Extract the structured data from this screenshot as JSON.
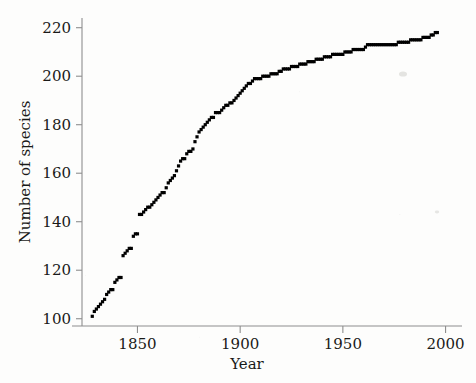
{
  "figure": {
    "background_color": "#fdfdfc",
    "marker_color": "#000000",
    "axis_color": "#8e8e8e"
  },
  "axes": {
    "x_label": "Year",
    "y_label": "Number of species",
    "x_ticks": [
      "1850",
      "1900",
      "1950",
      "2000"
    ],
    "y_ticks": [
      "100",
      "120",
      "140",
      "160",
      "180",
      "200",
      "220"
    ]
  },
  "chart_data": {
    "type": "scatter",
    "title": "",
    "xlabel": "Year",
    "ylabel": "Number of species",
    "xlim": [
      1823,
      2008
    ],
    "ylim": [
      97,
      224
    ],
    "xticks": [
      1850,
      1900,
      1950,
      2000
    ],
    "yticks": [
      100,
      120,
      140,
      160,
      180,
      200,
      220
    ],
    "grid": false,
    "legend": false,
    "marker": "square",
    "marker_color": "#000000",
    "series": [
      {
        "name": "Cumulative species described",
        "x": [
          1828,
          1830,
          1831,
          1832,
          1833,
          1834,
          1835,
          1836,
          1837,
          1838,
          1839,
          1840,
          1841,
          1842,
          1843,
          1844,
          1845,
          1846,
          1847,
          1848,
          1849,
          1850,
          1851,
          1852,
          1853,
          1854,
          1855,
          1856,
          1857,
          1858,
          1859,
          1860,
          1861,
          1862,
          1863,
          1864,
          1865,
          1866,
          1867,
          1868,
          1869,
          1870,
          1871,
          1872,
          1873,
          1874,
          1875,
          1876,
          1877,
          1878,
          1879,
          1880,
          1881,
          1882,
          1883,
          1884,
          1885,
          1886,
          1887,
          1888,
          1889,
          1890,
          1891,
          1892,
          1893,
          1894,
          1895,
          1896,
          1897,
          1898,
          1899,
          1900,
          1901,
          1902,
          1903,
          1904,
          1905,
          1906,
          1907,
          1908,
          1909,
          1910,
          1911,
          1912,
          1913,
          1914,
          1915,
          1916,
          1917,
          1918,
          1919,
          1920,
          1922,
          1924,
          1926,
          1928,
          1930,
          1932,
          1934,
          1936,
          1938,
          1940,
          1942,
          1944,
          1946,
          1948,
          1950,
          1952,
          1954,
          1956,
          1958,
          1960,
          1962,
          1964,
          1966,
          1968,
          1970,
          1972,
          1974,
          1976,
          1978,
          1980,
          1982,
          1984,
          1986,
          1988,
          1990,
          1992,
          1994,
          1996
        ],
        "y": [
          101,
          104,
          105,
          106,
          107,
          108,
          110,
          111,
          112,
          112,
          115,
          116,
          117,
          117,
          126,
          127,
          128,
          129,
          129,
          134,
          135,
          135,
          143,
          143,
          144,
          145,
          146,
          146,
          147,
          148,
          149,
          150,
          151,
          152,
          152,
          154,
          156,
          157,
          158,
          159,
          161,
          163,
          165,
          166,
          166,
          168,
          169,
          169,
          170,
          173,
          175,
          177,
          178,
          179,
          180,
          181,
          182,
          183,
          183,
          185,
          185,
          185,
          186,
          187,
          188,
          188,
          189,
          189,
          190,
          191,
          192,
          193,
          194,
          195,
          196,
          197,
          197,
          198,
          199,
          199,
          199,
          199,
          200,
          200,
          200,
          200,
          201,
          201,
          201,
          201,
          202,
          202,
          203,
          203,
          204,
          204,
          205,
          205,
          206,
          206,
          207,
          207,
          208,
          208,
          209,
          209,
          209,
          210,
          210,
          211,
          211,
          211,
          213,
          213,
          213,
          213,
          213,
          213,
          213,
          213,
          214,
          214,
          214,
          215,
          215,
          215,
          216,
          216,
          217,
          218
        ]
      }
    ]
  }
}
